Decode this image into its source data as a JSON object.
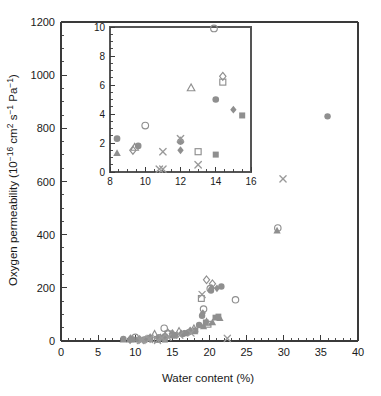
{
  "figure": {
    "width": 381,
    "height": 396,
    "background": "#ffffff",
    "marker_color": "#8f8f8f",
    "axis_color": "#3a3a3a"
  },
  "chart_data": {
    "type": "scatter",
    "title": "",
    "xlabel": "Water content (%)",
    "ylabel": "Oxygen permeability (10−16 cm2 s−1 Pa−1)",
    "ylabel_parts": {
      "prefix": "Oxygen permeability (10",
      "sup1": "−16",
      "mid1": " cm",
      "sup2": "2",
      "mid2": " s",
      "sup3": "−1",
      "mid3": " Pa",
      "sup4": "−1",
      "suffix": ")"
    },
    "xlim": [
      0,
      40
    ],
    "ylim": [
      0,
      1200
    ],
    "xticks": [
      0,
      5,
      10,
      15,
      20,
      25,
      30,
      35,
      40
    ],
    "yticks": [
      0,
      200,
      400,
      600,
      800,
      1000,
      1200
    ],
    "xticks_minor_step": 1,
    "yticks_minor_step": 50,
    "grid": false,
    "legend": false,
    "series": [
      {
        "name": "filled-circle",
        "marker": "circle-filled",
        "points": [
          [
            8.4,
            8
          ],
          [
            9.6,
            7
          ],
          [
            11.2,
            6
          ],
          [
            12.0,
            12
          ],
          [
            13.2,
            14
          ],
          [
            14.0,
            18
          ],
          [
            15.3,
            22
          ],
          [
            16.4,
            26
          ],
          [
            17.2,
            33
          ],
          [
            18.6,
            60
          ],
          [
            19.0,
            95
          ],
          [
            20.2,
            190
          ],
          [
            21.6,
            205
          ],
          [
            35.9,
            845
          ]
        ]
      },
      {
        "name": "filled-triangle",
        "marker": "triangle-filled",
        "points": [
          [
            8.4,
            5
          ],
          [
            10.6,
            8
          ],
          [
            12.0,
            16
          ],
          [
            13.4,
            15
          ],
          [
            15.0,
            20
          ],
          [
            16.6,
            28
          ],
          [
            18.0,
            36
          ],
          [
            19.2,
            55
          ],
          [
            20.4,
            70
          ],
          [
            21.4,
            86
          ],
          [
            29.1,
            415
          ]
        ]
      },
      {
        "name": "filled-diamond",
        "marker": "diamond-filled",
        "points": [
          [
            9.3,
            5
          ],
          [
            12.0,
            6
          ],
          [
            13.4,
            10
          ],
          [
            15.0,
            25
          ],
          [
            16.2,
            29
          ],
          [
            17.4,
            40
          ],
          [
            19.1,
            105
          ],
          [
            20.3,
            200
          ],
          [
            21.0,
            198
          ]
        ]
      },
      {
        "name": "filled-square",
        "marker": "square-filled",
        "points": [
          [
            10.4,
            5
          ],
          [
            14.0,
            5
          ],
          [
            15.4,
            22
          ],
          [
            16.8,
            30
          ],
          [
            18.1,
            40
          ],
          [
            19.5,
            70
          ],
          [
            20.8,
            88
          ],
          [
            21.2,
            92
          ]
        ]
      },
      {
        "name": "open-circle",
        "marker": "circle-open",
        "points": [
          [
            10.0,
            14
          ],
          [
            13.9,
            48
          ],
          [
            19.2,
            120
          ],
          [
            20.1,
            197
          ],
          [
            23.5,
            155
          ],
          [
            29.2,
            425
          ]
        ]
      },
      {
        "name": "open-triangle",
        "marker": "triangle-open",
        "points": [
          [
            9.4,
            7
          ],
          [
            12.6,
            25
          ],
          [
            15.9,
            36
          ],
          [
            17.9,
            46
          ],
          [
            19.6,
            70
          ]
        ]
      },
      {
        "name": "open-diamond",
        "marker": "diamond-open",
        "points": [
          [
            9.3,
            6
          ],
          [
            14.4,
            30
          ],
          [
            15.0,
            27
          ],
          [
            19.6,
            230
          ],
          [
            20.4,
            215
          ]
        ]
      },
      {
        "name": "open-square",
        "marker": "square-open",
        "points": [
          [
            13.0,
            6
          ],
          [
            14.4,
            27
          ],
          [
            18.9,
            160
          ],
          [
            19.8,
            63
          ]
        ]
      },
      {
        "name": "cross",
        "marker": "x-cross",
        "points": [
          [
            10.7,
            2
          ],
          [
            10.9,
            2
          ],
          [
            11.0,
            7
          ],
          [
            11.9,
            6
          ],
          [
            12.0,
            10
          ],
          [
            13.0,
            2
          ],
          [
            13.6,
            12
          ],
          [
            14.4,
            14
          ],
          [
            16.0,
            22
          ],
          [
            17.5,
            30
          ],
          [
            19.0,
            175
          ],
          [
            22.4,
            10
          ],
          [
            29.9,
            610
          ]
        ]
      }
    ],
    "inset": {
      "xlim": [
        8,
        16
      ],
      "ylim": [
        0,
        10
      ],
      "xticks": [
        8,
        10,
        12,
        14,
        16
      ],
      "yticks": [
        0,
        2,
        4,
        6,
        8,
        10
      ],
      "xticks_minor_step": 0.5,
      "yticks_minor_step": 0.5,
      "grid": false,
      "legend": false,
      "series": [
        {
          "name": "filled-circle",
          "marker": "circle-filled",
          "points": [
            [
              8.4,
              2.3
            ],
            [
              9.6,
              1.8
            ],
            [
              12.0,
              2.1
            ],
            [
              14.0,
              5.0
            ]
          ]
        },
        {
          "name": "filled-triangle",
          "marker": "triangle-filled",
          "points": [
            [
              8.4,
              1.3
            ],
            [
              12.0,
              2.2
            ]
          ]
        },
        {
          "name": "filled-diamond",
          "marker": "diamond-filled",
          "points": [
            [
              12.0,
              1.5
            ],
            [
              15.0,
              4.3
            ]
          ]
        },
        {
          "name": "filled-square",
          "marker": "square-filled",
          "points": [
            [
              14.0,
              1.2
            ],
            [
              15.5,
              3.9
            ]
          ]
        },
        {
          "name": "open-circle",
          "marker": "circle-open",
          "points": [
            [
              10.0,
              3.2
            ],
            [
              13.9,
              9.9
            ]
          ]
        },
        {
          "name": "open-triangle",
          "marker": "triangle-open",
          "points": [
            [
              9.4,
              1.7
            ],
            [
              12.6,
              5.8
            ]
          ]
        },
        {
          "name": "open-diamond",
          "marker": "diamond-open",
          "points": [
            [
              9.3,
              1.5
            ],
            [
              14.4,
              6.6
            ]
          ]
        },
        {
          "name": "open-square",
          "marker": "square-open",
          "points": [
            [
              13.0,
              1.4
            ],
            [
              14.4,
              6.2
            ]
          ]
        },
        {
          "name": "cross",
          "marker": "x-cross",
          "points": [
            [
              10.8,
              0.2
            ],
            [
              11.0,
              0.2
            ],
            [
              11.0,
              1.4
            ],
            [
              12.0,
              2.3
            ],
            [
              13.0,
              0.5
            ]
          ]
        }
      ]
    }
  }
}
